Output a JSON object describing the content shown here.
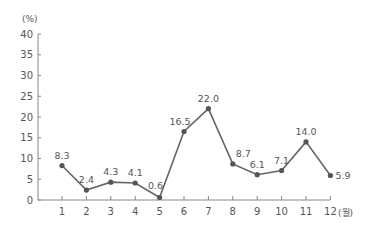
{
  "chart_data": {
    "type": "line",
    "title": "",
    "xlabel": "(월)",
    "ylabel": "(%)",
    "categories": [
      "1",
      "2",
      "3",
      "4",
      "5",
      "6",
      "7",
      "8",
      "9",
      "10",
      "11",
      "12"
    ],
    "values": [
      8.3,
      2.4,
      4.3,
      4.1,
      0.6,
      16.5,
      22.0,
      8.7,
      6.1,
      7.1,
      14.0,
      5.9
    ],
    "value_labels": [
      "8.3",
      "2.4",
      "4.3",
      "4.1",
      "0.6",
      "16.5",
      "22.0",
      "8.7",
      "6.1",
      "7.1",
      "14.0",
      "5.9"
    ],
    "ylim": [
      0,
      40
    ],
    "yticks": [
      0,
      5,
      10,
      15,
      20,
      25,
      30,
      35,
      40
    ],
    "grid": false,
    "legend": null,
    "colors": {
      "line": "#666666",
      "marker": "#555555",
      "axis": "#888888",
      "text": "#555555"
    }
  }
}
